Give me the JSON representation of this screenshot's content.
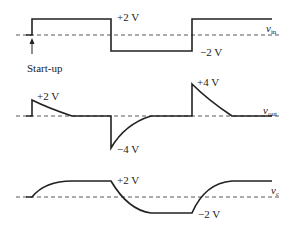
{
  "diagram": {
    "panels": [
      {
        "name": "v_in",
        "signal_label": "v",
        "signal_sub": "in",
        "annotations": {
          "high": "+2 V",
          "low": "−2 V",
          "startup": "Start-up"
        }
      },
      {
        "name": "v_out",
        "signal_label": "v",
        "signal_sub": "out",
        "annotations": {
          "pos_small": "+2 V",
          "neg": "−4 V",
          "pos_big": "+4 V"
        }
      },
      {
        "name": "v_c",
        "signal_label": "v",
        "signal_sub": "c",
        "annotations": {
          "high": "+2 V",
          "low": "−2 V"
        }
      }
    ]
  }
}
